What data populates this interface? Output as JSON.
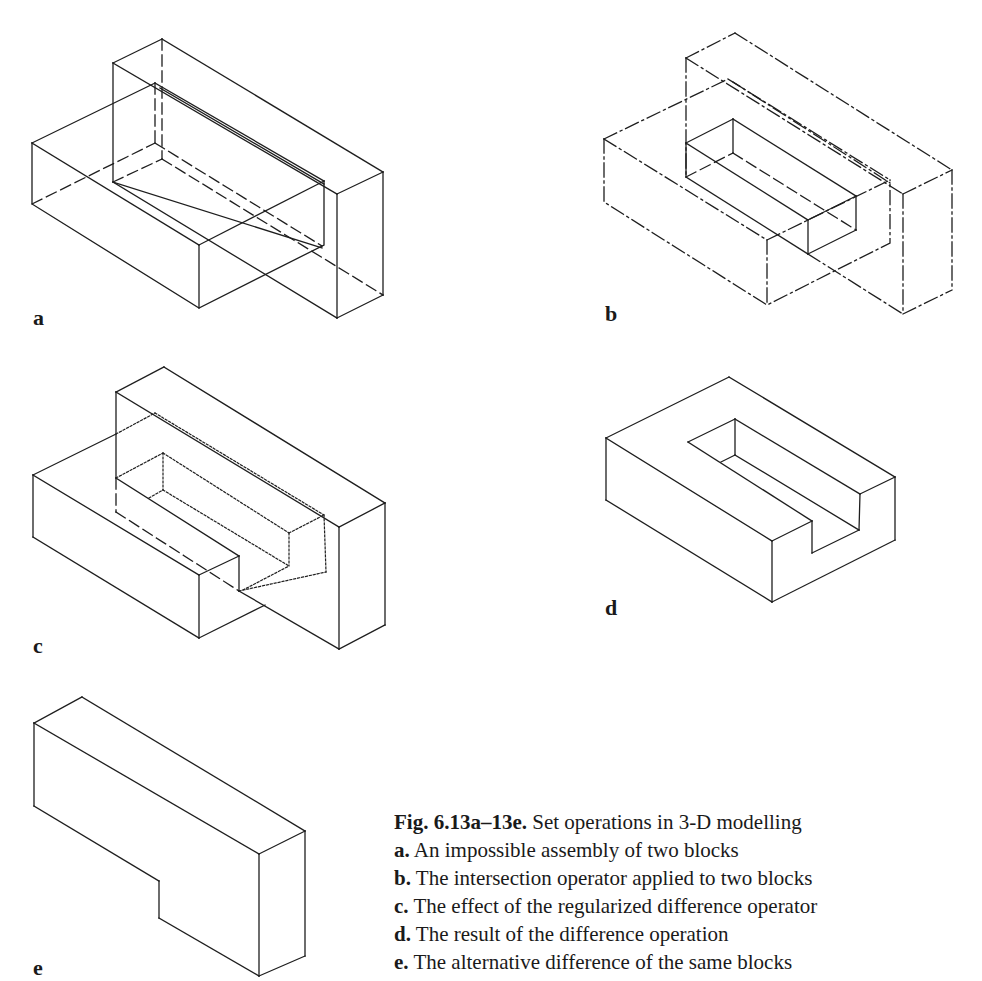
{
  "figure": {
    "panels": [
      {
        "id": "a",
        "label": "a",
        "description": "An impossible assembly of two blocks"
      },
      {
        "id": "b",
        "label": "b",
        "description": "The intersection operator applied to two blocks"
      },
      {
        "id": "c",
        "label": "c",
        "description": "The effect of the regularized difference operator"
      },
      {
        "id": "d",
        "label": "d",
        "description": "The result of the difference operation"
      },
      {
        "id": "e",
        "label": "e",
        "description": "The alternative difference of the same blocks"
      }
    ],
    "caption": {
      "number": "Fig. 6.13a–13e.",
      "title": "Set operations in 3-D modelling",
      "items": [
        {
          "key": "a.",
          "text": "An impossible assembly of two blocks"
        },
        {
          "key": "b.",
          "text": "The intersection operator applied to two blocks"
        },
        {
          "key": "c.",
          "text": "The effect of the regularized difference operator"
        },
        {
          "key": "d.",
          "text": "The result of the difference operation"
        },
        {
          "key": "e.",
          "text": "The alternative difference of the same blocks"
        }
      ]
    }
  }
}
